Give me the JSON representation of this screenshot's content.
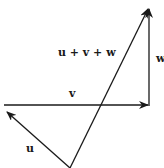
{
  "diagram": {
    "title": "",
    "vectors": [
      {
        "id": "u",
        "label": "u",
        "from": [
          70,
          168
        ],
        "to": [
          6,
          111
        ]
      },
      {
        "id": "v",
        "label": "v",
        "from": [
          4,
          105
        ],
        "to": [
          149,
          105
        ]
      },
      {
        "id": "w",
        "label": "w",
        "from": [
          149,
          105
        ],
        "to": [
          149,
          8
        ]
      },
      {
        "id": "sum",
        "label": "u + v + w",
        "from": [
          70,
          168
        ],
        "to": [
          149,
          8
        ]
      }
    ],
    "labels": {
      "u": "u",
      "v": "v",
      "w": "w",
      "sum": "u + v + w"
    },
    "colors": {
      "stroke": "#1a1a1a",
      "background": "#ffffff"
    }
  }
}
